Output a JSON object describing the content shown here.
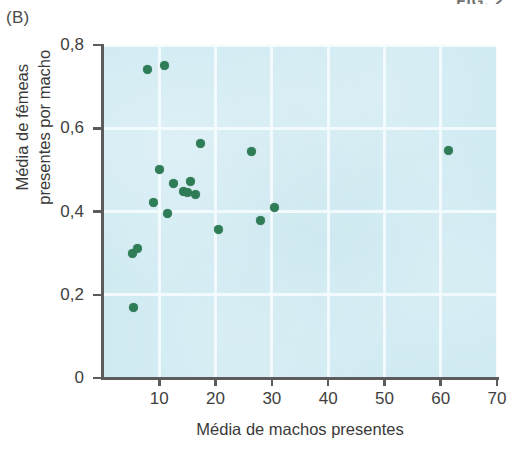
{
  "panel": {
    "label": "(B)"
  },
  "header": {
    "fragment": "FIG. 2"
  },
  "chart_data": {
    "type": "scatter",
    "title": "",
    "subtitle": "",
    "panel_label": "(B)",
    "xlabel": "Média de machos presentes",
    "ylabel_lines": [
      "Média de fêmeas",
      "presentes por macho"
    ],
    "ylabel": "Média de fêmeas presentes por macho",
    "xlim": [
      0,
      70
    ],
    "ylim": [
      0,
      0.8
    ],
    "xticks": [
      10,
      20,
      30,
      40,
      50,
      60,
      70
    ],
    "xtick_labels": [
      "10",
      "20",
      "30",
      "40",
      "50",
      "60",
      "70"
    ],
    "yticks": [
      0,
      0.2,
      0.4,
      0.6,
      0.8
    ],
    "ytick_labels": [
      "0",
      "0,2",
      "0,4",
      "0,6",
      "0,8"
    ],
    "grid": true,
    "grid_color": "#f3fbfd",
    "plot_background": "#cfeaf2",
    "marker_color": "#2f7d57",
    "marker_size": 9,
    "legend": null,
    "series": [
      {
        "name": "populações",
        "points": [
          {
            "x": 5.4,
            "y": 0.17
          },
          {
            "x": 5.3,
            "y": 0.3
          },
          {
            "x": 6.1,
            "y": 0.312
          },
          {
            "x": 7.9,
            "y": 0.74
          },
          {
            "x": 11.0,
            "y": 0.75
          },
          {
            "x": 9.0,
            "y": 0.422
          },
          {
            "x": 10.1,
            "y": 0.5
          },
          {
            "x": 11.4,
            "y": 0.396
          },
          {
            "x": 12.6,
            "y": 0.468
          },
          {
            "x": 14.3,
            "y": 0.447
          },
          {
            "x": 15.1,
            "y": 0.446
          },
          {
            "x": 15.5,
            "y": 0.473
          },
          {
            "x": 16.5,
            "y": 0.44
          },
          {
            "x": 17.3,
            "y": 0.563
          },
          {
            "x": 20.6,
            "y": 0.357
          },
          {
            "x": 26.4,
            "y": 0.545
          },
          {
            "x": 27.9,
            "y": 0.378
          },
          {
            "x": 30.5,
            "y": 0.41
          },
          {
            "x": 61.4,
            "y": 0.546
          }
        ]
      }
    ]
  }
}
